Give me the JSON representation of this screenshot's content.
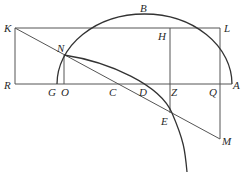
{
  "diagram": {
    "type": "geometric construction",
    "labels": {
      "K": "K",
      "B": "B",
      "H": "H",
      "L": "L",
      "N": "N",
      "R": "R",
      "G": "G",
      "O": "O",
      "C": "C",
      "D": "D",
      "Z": "Z",
      "Q": "Q",
      "A": "A",
      "E": "E",
      "M": "M"
    },
    "colors": {
      "line": "#555555",
      "curve": "#333333",
      "text": "#2a2a2a"
    }
  }
}
